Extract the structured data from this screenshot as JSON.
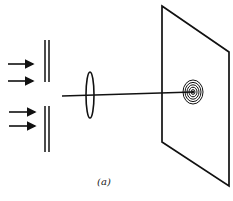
{
  "figure": {
    "caption": "(a)",
    "colors": {
      "ink": "#111111",
      "background": "#ffffff"
    }
  },
  "elements": {
    "incident_arrows": [
      {
        "x1": 8,
        "y1": 64,
        "x2": 33,
        "y2": 64
      },
      {
        "x1": 8,
        "y1": 81,
        "x2": 33,
        "y2": 81
      },
      {
        "x1": 9,
        "y1": 112,
        "x2": 35,
        "y2": 112
      },
      {
        "x1": 9,
        "y1": 126,
        "x2": 35,
        "y2": 126
      }
    ],
    "slit_plates": {
      "top": {
        "x_left": 45,
        "x_right": 49,
        "y_top": 40,
        "y_bottom": 82
      },
      "bottom": {
        "x_left": 45,
        "x_right": 49,
        "y_top": 106,
        "y_bottom": 152
      }
    },
    "lens": {
      "cx": 90,
      "cy": 95,
      "rx": 4,
      "ry": 23
    },
    "beam": {
      "x1": 62,
      "y1": 96,
      "x2": 193,
      "y2": 92
    },
    "screen": {
      "points": "162,6 229,52 229,186 162,142"
    },
    "rings": {
      "cx": 193,
      "cy": 92,
      "count": 5,
      "outer_rx": 10,
      "outer_ry": 12
    }
  }
}
